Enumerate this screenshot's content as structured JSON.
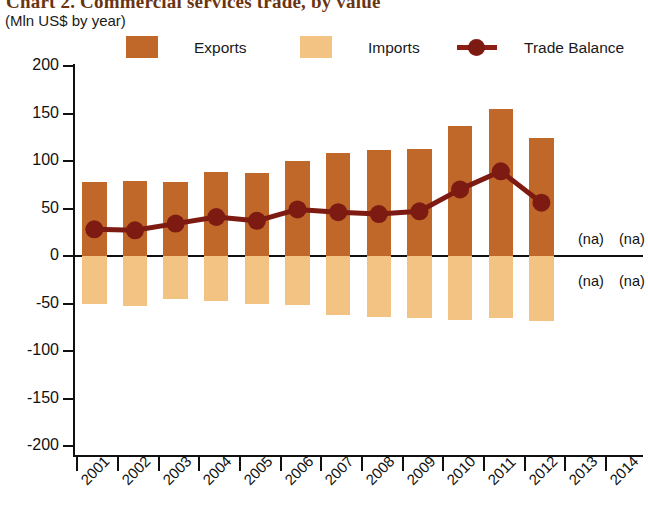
{
  "header": {
    "title": "Chart 2. Commercial services trade, by value",
    "subtitle": "(Mln US$ by year)"
  },
  "legend": {
    "items": [
      {
        "label": "Exports",
        "color": "#C0682A",
        "type": "swatch"
      },
      {
        "label": "Imports",
        "color": "#F3C384",
        "type": "swatch"
      },
      {
        "label": "Trade Balance",
        "color": "#7D1A12",
        "type": "line-marker"
      }
    ]
  },
  "annotations": {
    "na_labels": [
      "(na)",
      "(na)",
      "(na)",
      "(na)"
    ]
  },
  "axes": {
    "y_ticks": [
      "200",
      "150",
      "100",
      "50",
      "0",
      "-50",
      "-100",
      "-150",
      "-200"
    ],
    "x_ticks": [
      "2001",
      "2002",
      "2003",
      "2004",
      "2005",
      "2006",
      "2007",
      "2008",
      "2009",
      "2010",
      "2011",
      "2012",
      "2013",
      "2014"
    ]
  },
  "chart_data": {
    "type": "bar",
    "title": "Chart 2. Commercial services trade, by value",
    "subtitle": "(Mln US$ by year)",
    "xlabel": "",
    "ylabel": "Mln US$",
    "ylim": [
      -200,
      200
    ],
    "ytick_values": [
      200,
      150,
      100,
      50,
      0,
      -50,
      -100,
      -150,
      -200
    ],
    "grid": false,
    "legend_position": "top",
    "categories": [
      "2001",
      "2002",
      "2003",
      "2004",
      "2005",
      "2006",
      "2007",
      "2008",
      "2009",
      "2010",
      "2011",
      "2012",
      "2013",
      "2014"
    ],
    "series": [
      {
        "name": "Exports",
        "type": "bar",
        "color": "#C0682A",
        "values": [
          78,
          79,
          78,
          88,
          87,
          100,
          108,
          111,
          112,
          137,
          154,
          124,
          null,
          null
        ]
      },
      {
        "name": "Imports",
        "type": "bar",
        "color": "#F3C384",
        "values": [
          -50,
          -52,
          -45,
          -47,
          -50,
          -51,
          -62,
          -64,
          -65,
          -67,
          -65,
          -68,
          null,
          null
        ]
      },
      {
        "name": "Trade Balance",
        "type": "line",
        "color": "#7D1A12",
        "values": [
          28,
          27,
          34,
          41,
          37,
          49,
          46,
          44,
          47,
          70,
          89,
          56,
          null,
          null
        ]
      }
    ],
    "missing_data_note": "(na) shown for 2013 and 2014"
  }
}
